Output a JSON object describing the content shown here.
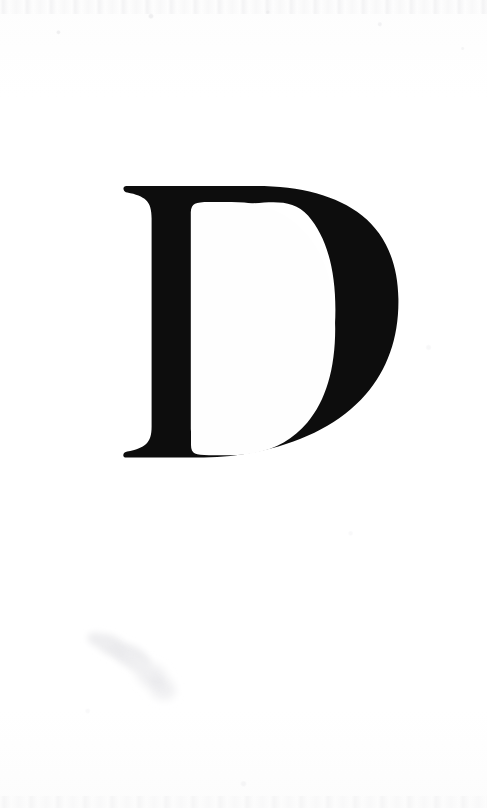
{
  "document": {
    "type": "scanned-book-page",
    "page_width": 487,
    "page_height": 808,
    "background_color": "#fefefe",
    "caption": "Scanned page bearing a single large serif capital letter"
  },
  "dropcap": {
    "letter": "D",
    "role": "drop-cap-initial",
    "style": "serif",
    "ink_color": "#0d0d0d",
    "bounds": {
      "x": 122,
      "y": 186,
      "width": 276,
      "height": 272
    },
    "counter_bounds": {
      "x": 190,
      "y": 205,
      "width": 140,
      "height": 230
    },
    "stem": {
      "x": 148,
      "width": 34
    }
  },
  "artifacts": {
    "smudge": {
      "label": "ink-smudge-stain",
      "color": "#f1f1f2",
      "bounds": {
        "x": 88,
        "y": 628,
        "width": 92,
        "height": 76
      }
    },
    "edge_noise_top": {
      "label": "scan-edge-noise",
      "color": "#e8e8ea"
    },
    "edge_noise_bottom": {
      "label": "scan-edge-noise",
      "color": "#ebebed"
    }
  }
}
